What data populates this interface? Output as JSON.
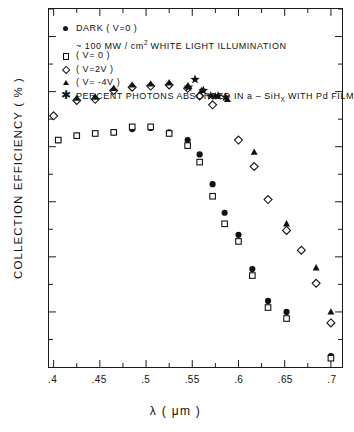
{
  "chart_data": {
    "type": "scatter",
    "title": "",
    "xlabel": "λ ( μm )",
    "ylabel": "COLLECTION EFFICIENCY ( % )",
    "xlim": [
      0.395,
      0.712
    ],
    "ylim": [
      0,
      32.5
    ],
    "xticks": [
      0.4,
      0.45,
      0.5,
      0.55,
      0.6,
      0.65,
      0.7
    ],
    "xticklabels": [
      ".4",
      ".45",
      ".5",
      ".55",
      ".6",
      ".65",
      ".7"
    ],
    "yticks": [
      5,
      10,
      15,
      20,
      25,
      30
    ],
    "yticklabels": [
      "5",
      "10",
      "15",
      "20",
      "25",
      "30"
    ],
    "yminorticks": [
      2.5,
      7.5,
      12.5,
      17.5,
      22.5,
      27.5,
      32.5
    ],
    "grid": false,
    "legend_position": "upper-left-inside",
    "series": [
      {
        "name": "DARK ( V=0 )",
        "marker": "filled-circle",
        "color": "#111111",
        "points": [
          [
            0.405,
            20.6
          ],
          [
            0.425,
            21.0
          ],
          [
            0.445,
            21.2
          ],
          [
            0.465,
            21.3
          ],
          [
            0.485,
            21.6
          ],
          [
            0.505,
            21.7
          ],
          [
            0.525,
            21.3
          ],
          [
            0.545,
            20.6
          ],
          [
            0.558,
            19.3
          ],
          [
            0.572,
            16.6
          ],
          [
            0.585,
            14.0
          ],
          [
            0.6,
            12.0
          ],
          [
            0.615,
            8.9
          ],
          [
            0.632,
            6.0
          ],
          [
            0.652,
            5.0
          ],
          [
            0.7,
            1.0
          ]
        ]
      },
      {
        "name": "( V=0 )",
        "marker": "open-square",
        "color": "#111111",
        "points": [
          [
            0.405,
            20.6
          ],
          [
            0.425,
            21.0
          ],
          [
            0.445,
            21.2
          ],
          [
            0.465,
            21.3
          ],
          [
            0.485,
            21.8
          ],
          [
            0.505,
            21.8
          ],
          [
            0.525,
            21.2
          ],
          [
            0.545,
            20.1
          ],
          [
            0.558,
            18.6
          ],
          [
            0.572,
            15.5
          ],
          [
            0.585,
            13.0
          ],
          [
            0.6,
            11.4
          ],
          [
            0.615,
            8.3
          ],
          [
            0.632,
            5.4
          ],
          [
            0.652,
            4.4
          ],
          [
            0.7,
            0.8
          ]
        ]
      },
      {
        "name": "( V=2V )",
        "marker": "open-diamond",
        "color": "#111111",
        "points": [
          [
            0.4,
            22.8
          ],
          [
            0.425,
            24.2
          ],
          [
            0.445,
            24.3
          ],
          [
            0.465,
            25.1
          ],
          [
            0.485,
            25.4
          ],
          [
            0.505,
            25.5
          ],
          [
            0.525,
            25.6
          ],
          [
            0.545,
            25.3
          ],
          [
            0.558,
            24.6
          ],
          [
            0.572,
            23.8
          ],
          [
            0.6,
            20.6
          ],
          [
            0.617,
            18.2
          ],
          [
            0.632,
            15.2
          ],
          [
            0.652,
            12.4
          ],
          [
            0.668,
            10.6
          ],
          [
            0.684,
            7.6
          ],
          [
            0.7,
            4.0
          ]
        ]
      },
      {
        "name": "( V= -4V )",
        "marker": "filled-triangle",
        "color": "#111111",
        "points": [
          [
            0.425,
            24.4
          ],
          [
            0.445,
            24.5
          ],
          [
            0.465,
            25.3
          ],
          [
            0.485,
            25.6
          ],
          [
            0.505,
            25.7
          ],
          [
            0.525,
            25.8
          ],
          [
            0.545,
            25.5
          ],
          [
            0.56,
            25.1
          ],
          [
            0.575,
            24.6
          ],
          [
            0.588,
            24.3
          ],
          [
            0.617,
            19.5
          ],
          [
            0.652,
            13.0
          ],
          [
            0.684,
            9.0
          ],
          [
            0.7,
            5.0
          ]
        ]
      },
      {
        "name": "PERCENT PHOTONS ABSORBED IN a - SiH_x WITH Pd FILM",
        "marker": "filled-star",
        "color": "#111111",
        "points": [
          [
            0.546,
            25.4
          ],
          [
            0.553,
            26.1
          ],
          [
            0.562,
            25.1
          ],
          [
            0.57,
            24.6
          ],
          [
            0.578,
            24.6
          ],
          [
            0.586,
            24.5
          ]
        ]
      }
    ]
  },
  "legend": {
    "rows": [
      {
        "symbol": "filled-circle",
        "text": "DARK  ( V=0 )"
      },
      {
        "symbol": "tilde",
        "text": "100  MW / cm2  WHITE  LIGHT  ILLUMINATION"
      },
      {
        "symbol": "open-square",
        "text": "( V= 0 )"
      },
      {
        "symbol": "open-diamond",
        "text": "( V=2V )"
      },
      {
        "symbol": "filled-triangle",
        "text": "( V= -4V )"
      },
      {
        "symbol": "filled-star",
        "text": "PERCENT  PHOTONS  ABSORBED  IN  a - SiH"
      }
    ],
    "row2_prefix": "~ 100  MW / cm",
    "row2_sup": "2",
    "row2_rest": "WHITE  LIGHT  ILLUMINATION",
    "row6_prefix": "PERCENT  PHOTONS  ABSORBED  IN  a – SiH",
    "row6_sub": "X",
    "row6_rest": "WITH  Pd  FILM"
  },
  "colors": {
    "axis": "#1a1a1a",
    "marker": "#111111",
    "background": "#ffffff"
  }
}
